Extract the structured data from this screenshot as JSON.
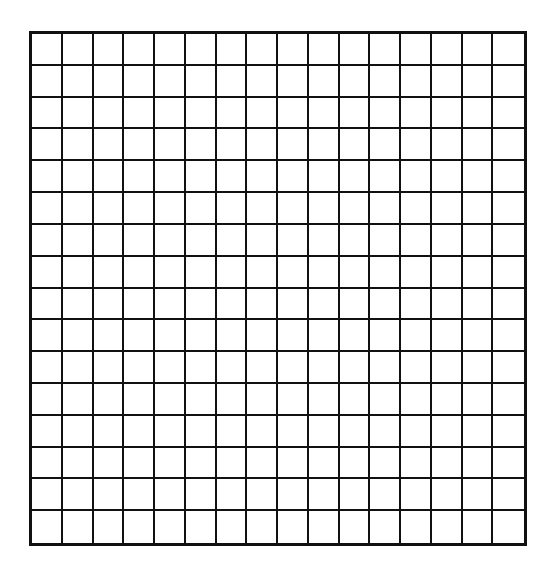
{
  "grid": {
    "rows": 16,
    "columns": 16,
    "line_color": "#111111",
    "background_color": "#ffffff"
  }
}
